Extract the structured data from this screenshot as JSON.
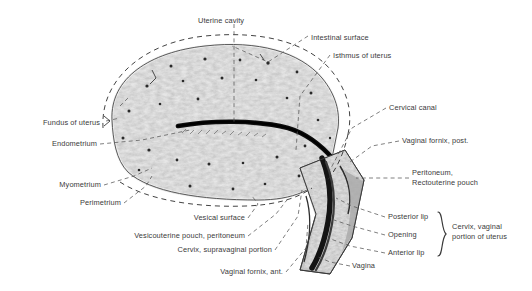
{
  "figure": {
    "type": "anatomical-illustration",
    "style": "grayscale engraving",
    "background_color": "#ffffff",
    "text_color": "#3a3a3a",
    "tissue_color": "#c8c8c8",
    "outline_color": "#4a4a4a"
  },
  "labels": [
    {
      "id": "uterine-cavity",
      "text": "Uterine cavity",
      "x": 198,
      "y": 16,
      "align": "left"
    },
    {
      "id": "intestinal-surface",
      "text": "Intestinal surface",
      "x": 311,
      "y": 33,
      "align": "left"
    },
    {
      "id": "isthmus-of-uterus",
      "text": "Isthmus of uterus",
      "x": 333,
      "y": 51,
      "align": "left"
    },
    {
      "id": "cervical-canal",
      "text": "Cervical canal",
      "x": 389,
      "y": 106,
      "align": "left"
    },
    {
      "id": "vaginal-fornix-post",
      "text": "Vaginal fornix, post.",
      "x": 402,
      "y": 139,
      "align": "left"
    },
    {
      "id": "peritoneum-rectouterine-pouch",
      "text": "Peritoneum,\nRectouterine pouch",
      "x": 412,
      "y": 175,
      "align": "left"
    },
    {
      "id": "posterior-lip",
      "text": "Posterior lip",
      "x": 388,
      "y": 215,
      "align": "left"
    },
    {
      "id": "opening",
      "text": "Opening",
      "x": 388,
      "y": 233,
      "align": "left"
    },
    {
      "id": "anterior-lip",
      "text": "Anterior lip",
      "x": 388,
      "y": 251,
      "align": "left"
    },
    {
      "id": "cervix-vaginal-portion",
      "text": "Cervix, vaginal\nportion of uterus",
      "x": 452,
      "y": 224,
      "align": "left"
    },
    {
      "id": "vagina",
      "text": "Vagina",
      "x": 352,
      "y": 264,
      "align": "left"
    },
    {
      "id": "vaginal-fornix-ant",
      "text": "Vaginal fornix, ant.",
      "x": 283,
      "y": 270,
      "align": "right"
    },
    {
      "id": "cervix-supravaginal",
      "text": "Cervix, supravaginal portion",
      "x": 272,
      "y": 248,
      "align": "right"
    },
    {
      "id": "vesicouterine-pouch",
      "text": "Vesicouterine pouch, peritoneum",
      "x": 245,
      "y": 234,
      "align": "right"
    },
    {
      "id": "vesical-surface",
      "text": "Vesical surface",
      "x": 245,
      "y": 216,
      "align": "right"
    },
    {
      "id": "perimetrium",
      "text": "Perimetrium",
      "x": 121,
      "y": 201,
      "align": "right"
    },
    {
      "id": "myometrium",
      "text": "Myometrium",
      "x": 101,
      "y": 183,
      "align": "right"
    },
    {
      "id": "endometrium",
      "text": "Endometrium",
      "x": 97,
      "y": 142,
      "align": "right"
    },
    {
      "id": "fundus-of-uterus",
      "text": "Fundus of uterus",
      "x": 100,
      "y": 121,
      "align": "right"
    }
  ],
  "brace": {
    "id": "cervix-brace",
    "x": 437,
    "y": 211,
    "height": 46
  }
}
